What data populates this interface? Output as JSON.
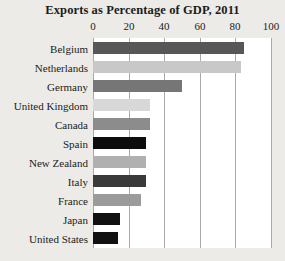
{
  "chart_data": {
    "type": "bar",
    "orientation": "horizontal",
    "title": "Exports as Percentage of GDP, 2011",
    "xlabel": "",
    "ylabel": "",
    "xlim": [
      0,
      100
    ],
    "xticks": [
      0,
      20,
      40,
      60,
      80,
      100
    ],
    "xtick_labels": [
      "0",
      "20",
      "40",
      "60",
      "80",
      "100"
    ],
    "grid": "vertical",
    "legend": "none",
    "categories": [
      "Belgium",
      "Netherlands",
      "Germany",
      "United Kingdom",
      "Canada",
      "Spain",
      "New Zealand",
      "Italy",
      "France",
      "Japan",
      "United States"
    ],
    "values": [
      85,
      83,
      50,
      32,
      32,
      30,
      30,
      30,
      27,
      15,
      14
    ],
    "bar_colors": [
      "#575757",
      "#c8c8c8",
      "#767676",
      "#d8d8d8",
      "#8c8c8c",
      "#0d0d0d",
      "#b0b0b0",
      "#3a3a3a",
      "#9b9b9b",
      "#111111",
      "#111111"
    ]
  },
  "style": {
    "background": "#ecebe7",
    "plot_background": "#ffffff",
    "gridline_color": "#a9a9a9",
    "text_color": "#1b1b1b"
  }
}
